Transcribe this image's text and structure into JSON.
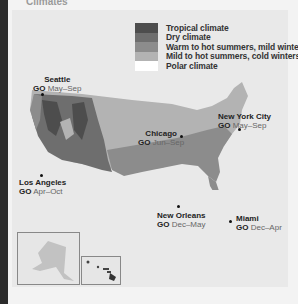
{
  "header": {
    "title_partial": "Climates"
  },
  "legend": {
    "items": [
      {
        "label": "Tropical climate",
        "color": "#4d4d4d"
      },
      {
        "label": "Dry climate",
        "color": "#6e6e6e"
      },
      {
        "label": "Warm to hot summers, mild winters",
        "color": "#8c8c8c"
      },
      {
        "label": "Mild to hot summers, cold winters",
        "color": "#b3b3b3"
      },
      {
        "label": "Polar climate",
        "color": "#ffffff"
      }
    ]
  },
  "cities": [
    {
      "name": "Seattle",
      "go": "GO",
      "months": "May–Sep"
    },
    {
      "name": "Chicago",
      "go": "GO",
      "months": "Jun–Sep"
    },
    {
      "name": "New York City",
      "go": "GO",
      "months": "May–Sep"
    },
    {
      "name": "Los Angeles",
      "go": "GO",
      "months": "Apr–Oct"
    },
    {
      "name": "New Orleans",
      "go": "GO",
      "months": "Dec–May"
    },
    {
      "name": "Miami",
      "go": "GO",
      "months": "Dec–Apr"
    }
  ],
  "insets": {
    "alaska": "Alaska",
    "hawaii": "Hawaii"
  }
}
